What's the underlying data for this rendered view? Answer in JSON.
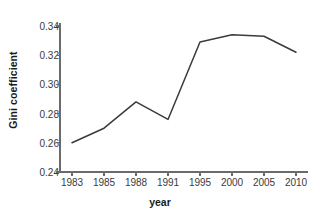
{
  "chart_data": {
    "type": "line",
    "title": "",
    "subtitle": "",
    "xlabel": "year",
    "ylabel": "Gini coefficient",
    "categories": [
      "1983",
      "1985",
      "1988",
      "1991",
      "1995",
      "2000",
      "2005",
      "2010"
    ],
    "values": [
      0.26,
      0.27,
      0.288,
      0.276,
      0.329,
      0.334,
      0.333,
      0.322
    ],
    "series": [
      {
        "name": "Gini coefficient",
        "values": [
          0.26,
          0.27,
          0.288,
          0.276,
          0.329,
          0.334,
          0.333,
          0.322
        ]
      }
    ],
    "ylim": [
      0.24,
      0.34
    ],
    "yticks": [
      0.24,
      0.26,
      0.28,
      0.3,
      0.32,
      0.34
    ],
    "ytick_labels": [
      "0.24",
      "0.26",
      "0.28",
      "0.30",
      "0.32",
      "0.34"
    ],
    "xtick_labels": [
      "1983",
      "1985",
      "1988",
      "1991",
      "1995",
      "2000",
      "2005",
      "2010"
    ],
    "grid": false,
    "legend": false,
    "legend_position": "none",
    "line_color": "#3b3b3b",
    "axis_color": "#6b6b6b",
    "background_color": "#ffffff",
    "annotations": []
  }
}
